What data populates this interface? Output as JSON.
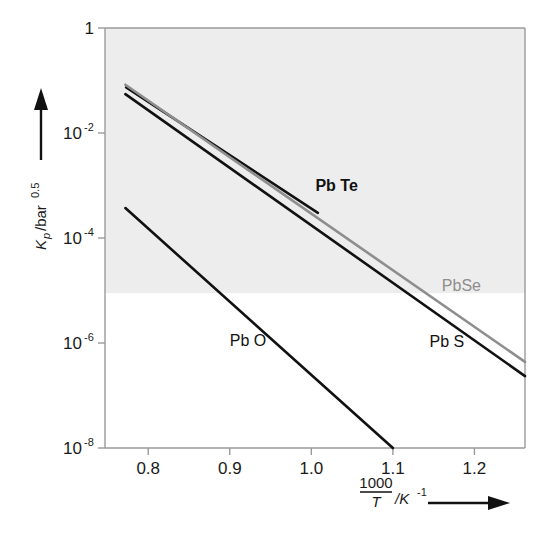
{
  "figure": {
    "background_color": "#ffffff",
    "shade_color": "#ededed",
    "frame_color": "#9a9a9a"
  },
  "chart_data": {
    "type": "line",
    "title": "",
    "xlabel": "1000/T /K⁻¹",
    "ylabel": "K_p /bar^0.5",
    "xlabel_parts": {
      "numerator": "1000",
      "denominator": "T",
      "unit": "/K",
      "unit_exponent": "-1",
      "arrow": "→"
    },
    "ylabel_parts": {
      "symbol": "K",
      "subscript": "p",
      "unit": "/bar",
      "unit_exponent": "0.5",
      "arrow": "↑"
    },
    "xlim": [
      0.747,
      1.262
    ],
    "ylim_exponent": [
      -8,
      0
    ],
    "yscale": "log",
    "grid": false,
    "legend": "inline-labels",
    "xticks": [
      "0.8",
      "0.9",
      "1.0",
      "1.1",
      "1.2"
    ],
    "xtick_values": [
      0.8,
      0.9,
      1.0,
      1.1,
      1.2
    ],
    "yticks": [
      {
        "label": "1",
        "mantissa": "1",
        "exponent": "",
        "value_exponent": 0
      },
      {
        "label": "10-2",
        "mantissa": "10",
        "exponent": "-2",
        "value_exponent": -2
      },
      {
        "label": "10-4",
        "mantissa": "10",
        "exponent": "-4",
        "value_exponent": -4
      },
      {
        "label": "10-6",
        "mantissa": "10",
        "exponent": "-6",
        "value_exponent": -6
      },
      {
        "label": "10-8",
        "mantissa": "10",
        "exponent": "-8",
        "value_exponent": -8
      }
    ],
    "shaded_region": {
      "y_top_exponent": 0,
      "y_bottom_exponent": -5.05,
      "color": "#ededed"
    },
    "series": [
      {
        "name": "Pb Te",
        "color": "#111111",
        "label_x": 1.005,
        "label_y_exponent": -3.1,
        "x": [
          0.773,
          1.008
        ],
        "y_exponent": [
          -1.13,
          -3.52
        ]
      },
      {
        "name": "PbSe",
        "color": "#8e8e8e",
        "label_x": 1.16,
        "label_y_exponent": -5.0,
        "x": [
          0.772,
          1.262
        ],
        "y_exponent": [
          -1.08,
          -6.36
        ]
      },
      {
        "name": "Pb S",
        "color": "#111111",
        "label_x": 1.145,
        "label_y_exponent": -6.08,
        "x": [
          0.772,
          1.262
        ],
        "y_exponent": [
          -1.26,
          -6.63
        ]
      },
      {
        "name": "Pb O",
        "color": "#111111",
        "label_x": 0.9,
        "label_y_exponent": -6.05,
        "x": [
          0.772,
          1.1
        ],
        "y_exponent": [
          -3.43,
          -8.0
        ]
      }
    ]
  }
}
